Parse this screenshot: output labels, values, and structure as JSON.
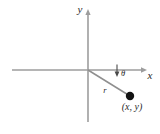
{
  "figure": {
    "background_color": "#ffffff",
    "axis_color": "#9d9d9d",
    "ray_color": "#8f8f8f",
    "point_color": "#131313",
    "label_color": "#2b2b2b"
  },
  "labels": {
    "y_axis": "y",
    "x_axis": "x",
    "radius": "r",
    "angle": "θ",
    "point": "(x, y)"
  },
  "geometry": {
    "origin": {
      "x": 88,
      "y": 70
    },
    "x_axis": {
      "x1": 12,
      "y1": 70,
      "x2": 147,
      "y2": 70
    },
    "y_axis": {
      "x1": 88,
      "y1": 10,
      "x2": 88,
      "y2": 122
    },
    "ray": {
      "x1": 88,
      "y1": 70,
      "x2": 130,
      "y2": 96
    },
    "point": {
      "x": 130,
      "y": 96,
      "radius": 4
    },
    "angle_marker": {
      "x": 117,
      "y": 70,
      "length": 8
    }
  },
  "label_positions": {
    "y_axis": {
      "x": 80,
      "y": 13
    },
    "x_axis": {
      "x": 150,
      "y": 79
    },
    "radius": {
      "x": 105,
      "y": 93
    },
    "angle": {
      "x": 122,
      "y": 76
    },
    "point": {
      "x": 132,
      "y": 109
    }
  }
}
